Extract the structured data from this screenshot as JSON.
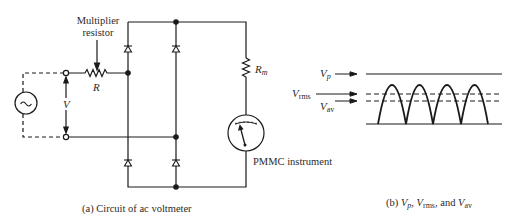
{
  "circuit": {
    "multiplier_label_line1": "Multiplier",
    "multiplier_label_line2": "resistor",
    "resistor_label": "R",
    "voltage_label": "V",
    "meter_resistor_label_main": "R",
    "meter_resistor_label_sub": "m",
    "instrument_label": "PMMC instrument",
    "source_symbol": "~",
    "caption": "(a) Circuit of ac voltmeter"
  },
  "waveform": {
    "vp_main": "V",
    "vp_sub": "p",
    "vrms_main": "V",
    "vrms_sub": "rms",
    "vav_main": "V",
    "vav_sub": "av",
    "caption_prefix": "(b) ",
    "caption_vp": "V",
    "caption_vp_sub": "p",
    "caption_sep1": ", ",
    "caption_vrms": "V",
    "caption_vrms_sub": "rms",
    "caption_sep2": ", and ",
    "caption_vav": "V",
    "caption_vav_sub": "av",
    "half_cycles": 4
  },
  "colors": {
    "line": "#1a1a1a",
    "text": "#2a2a2a",
    "background": "#ffffff"
  }
}
